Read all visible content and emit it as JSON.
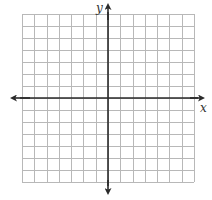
{
  "diagram": {
    "type": "coordinate-plane",
    "grid": {
      "columns": 14,
      "rows": 14,
      "cells_left_of_y_axis": 7,
      "cells_right_of_y_axis": 7,
      "cells_above_x_axis": 7,
      "cells_below_x_axis": 7,
      "line_color": "#b8b8b8"
    },
    "axes": {
      "x_label": "x",
      "y_label": "y",
      "color": "#2a2a2a",
      "arrows": "both-ends"
    }
  }
}
